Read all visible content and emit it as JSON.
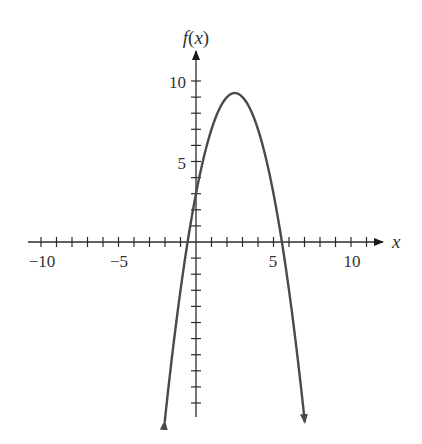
{
  "chart_data": {
    "type": "line",
    "title": "",
    "xlabel": "x",
    "ylabel": "f(x)",
    "function": "f(x) = -x^2 + 5x + 3",
    "xlim": [
      -11,
      12
    ],
    "ylim": [
      -11,
      11
    ],
    "x_tick_labels": [
      "-10",
      "-5",
      "5",
      "10"
    ],
    "x_tick_values": [
      -10,
      -5,
      5,
      10
    ],
    "y_tick_labels": [
      "5",
      "10"
    ],
    "y_tick_values": [
      5,
      10
    ],
    "minor_tick_step": 1,
    "grid": false,
    "curve_x_range": [
      -2.02,
      7.02
    ],
    "vertex": [
      2.5,
      9.25
    ],
    "y_intercept": 3,
    "x_intercepts": [
      -0.54,
      5.54
    ],
    "arrows_on_ends": true,
    "series": [
      {
        "name": "f(x)",
        "x": [
          -2,
          -1,
          0,
          1,
          2,
          2.5,
          3,
          4,
          5,
          6,
          7
        ],
        "values": [
          -11,
          -3,
          3,
          7,
          9,
          9.25,
          9,
          7,
          3,
          -3,
          -11
        ]
      }
    ]
  },
  "labels": {
    "x_axis": "x",
    "y_axis_f": "f",
    "y_axis_rest": "(x)",
    "tick_neg10": "−10",
    "tick_neg5": "−5",
    "tick_5x": "5",
    "tick_10x": "10",
    "tick_5y": "5",
    "tick_10y": "10"
  },
  "colors": {
    "axis": "#2b2b2b",
    "curve": "#4a4a4a",
    "text": "#333333"
  }
}
